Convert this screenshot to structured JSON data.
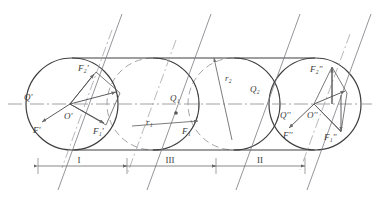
{
  "figure": {
    "type": "engineering-diagram",
    "background": "#ffffff",
    "line_color": "#4a4a4a",
    "thin_color": "#8a8a8a",
    "dash_color": "#8f8f96"
  },
  "axis": {
    "centerline_y": 104,
    "x_start": 8,
    "x_end": 372
  },
  "circles": [
    {
      "id": "left",
      "cx": 72,
      "cy": 104,
      "r": 46,
      "style": "solid",
      "name": "circle-left"
    },
    {
      "id": "mid1",
      "cx": 153,
      "cy": 104,
      "r": 46,
      "style": "dashed",
      "name": "circle-mid-1"
    },
    {
      "id": "mid2",
      "cx": 234,
      "cy": 104,
      "r": 46,
      "style": "dashed",
      "name": "circle-mid-2"
    },
    {
      "id": "right",
      "cx": 315,
      "cy": 104,
      "r": 46,
      "style": "solid",
      "name": "circle-right"
    }
  ],
  "tangents": {
    "top_y": 58,
    "bottom_y": 150,
    "x1": 72,
    "x2": 315
  },
  "hatch_lines": [
    {
      "x_top": 122,
      "y_top": 14,
      "x_bot": 58,
      "y_bot": 190
    },
    {
      "x_top": 211,
      "y_top": 14,
      "x_bot": 147,
      "y_bot": 190
    },
    {
      "x_top": 300,
      "y_top": 14,
      "x_bot": 236,
      "y_bot": 190
    },
    {
      "x_top": 371,
      "y_top": 14,
      "x_bot": 307,
      "y_bot": 190
    }
  ],
  "labels": {
    "left_circle": {
      "Q_prime": "Q'",
      "O_prime": "O'",
      "F2_prime": "F₂'",
      "F_prime": "F'",
      "F1_prime": "F₁'"
    },
    "right_circle": {
      "Q_dprime": "Q''",
      "O_dprime": "O''",
      "F2_dprime": "F₂''",
      "F_dprime": "F''",
      "F1_dprime": "F₁''"
    },
    "mid": {
      "Q1": "Q₁",
      "Q2": "Q₂",
      "r1": "r₁",
      "r2": "r₂",
      "F1": "F₁"
    }
  },
  "dimensions": {
    "line_y": 166,
    "spans": [
      {
        "label": "I",
        "x1": 38,
        "x2": 127,
        "name": "dimension-span-I"
      },
      {
        "label": "III",
        "x1": 127,
        "x2": 216,
        "name": "dimension-span-III"
      },
      {
        "label": "II",
        "x1": 216,
        "x2": 305,
        "name": "dimension-span-II"
      }
    ]
  },
  "vectors": {
    "left": {
      "origin_x": 70,
      "origin_y": 104,
      "F2_tip_x": 96,
      "F2_tip_y": 72,
      "F1_tip_x": 106,
      "F1_tip_y": 125,
      "R_tip_x": 93,
      "R_tip_y": 88,
      "Fp_tip_x": 42,
      "Fp_tip_y": 124
    },
    "right": {
      "origin_x": 314,
      "origin_y": 104,
      "F2_tip_x": 332,
      "F2_tip_y": 66,
      "F1_tip_x": 342,
      "F1_tip_y": 132,
      "R_tip_x": 342,
      "R_tip_y": 90,
      "Fp_tip_x": 288,
      "Fp_tip_y": 130
    },
    "mid1": {
      "origin_x": 153,
      "origin_y": 104,
      "tip_x": 198,
      "tip_y": 120,
      "dot_x": 176,
      "dot_y": 112
    },
    "mid2": {
      "origin_x": 234,
      "origin_y": 104,
      "tip_x": 212,
      "tip_y": 60
    }
  }
}
